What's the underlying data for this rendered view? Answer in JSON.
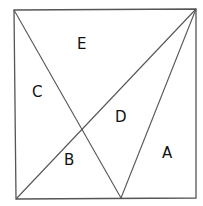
{
  "diagram": {
    "type": "square partitioned into regions",
    "stroke_color": "#555555",
    "regions": [
      {
        "label": "A",
        "x": 167,
        "y": 158
      },
      {
        "label": "B",
        "x": 69,
        "y": 165
      },
      {
        "label": "C",
        "x": 37,
        "y": 97
      },
      {
        "label": "D",
        "x": 120,
        "y": 122
      },
      {
        "label": "E",
        "x": 82,
        "y": 49
      }
    ]
  }
}
